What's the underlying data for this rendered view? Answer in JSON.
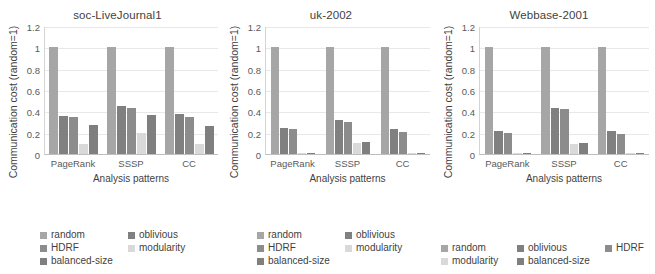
{
  "figure": {
    "background": "#ffffff",
    "series_colors": {
      "random": "#a6a6a6",
      "oblivious": "#808080",
      "HDRF": "#8c8c8c",
      "modularity": "#d9d9d9",
      "balanced-size": "#7f7f7f"
    }
  },
  "axis": {
    "ylabel": "Communication cost (random=1)",
    "xlabel": "Analysis patterns",
    "yticks": [
      "0",
      "0.2",
      "0.4",
      "0.6",
      "0.8",
      "1",
      "1.2"
    ],
    "ymin": 0,
    "ymax": 1.2,
    "xticks": [
      "PageRank",
      "SSSP",
      "CC"
    ]
  },
  "legend": {
    "entries": [
      "random",
      "oblivious",
      "HDRF",
      "modularity",
      "balanced-size"
    ],
    "layout_two_column": [
      "random",
      "oblivious",
      "HDRF",
      "modularity",
      "balanced-size"
    ],
    "layout_three_column": [
      "random",
      "oblivious",
      "HDRF",
      "modularity",
      "balanced-size"
    ]
  },
  "chart_data": [
    {
      "type": "bar",
      "title": "soc-LiveJournal1",
      "xlabel": "Analysis patterns",
      "ylabel": "Communication cost (random=1)",
      "ylim": [
        0,
        1.2
      ],
      "grid": true,
      "legend_position": "bottom",
      "categories": [
        "PageRank",
        "SSSP",
        "CC"
      ],
      "series": [
        {
          "name": "random",
          "values": [
            1.0,
            1.0,
            1.0
          ]
        },
        {
          "name": "oblivious",
          "values": [
            0.355,
            0.45,
            0.375
          ]
        },
        {
          "name": "HDRF",
          "values": [
            0.35,
            0.43,
            0.35
          ]
        },
        {
          "name": "modularity",
          "values": [
            0.09,
            0.2,
            0.09
          ]
        },
        {
          "name": "balanced-size",
          "values": [
            0.275,
            0.365,
            0.265
          ]
        }
      ]
    },
    {
      "type": "bar",
      "title": "uk-2002",
      "xlabel": "Analysis patterns",
      "ylabel": "Communication cost (random=1)",
      "ylim": [
        0,
        1.2
      ],
      "grid": true,
      "legend_position": "bottom",
      "categories": [
        "PageRank",
        "SSSP",
        "CC"
      ],
      "series": [
        {
          "name": "random",
          "values": [
            1.0,
            1.0,
            1.0
          ]
        },
        {
          "name": "oblivious",
          "values": [
            0.24,
            0.32,
            0.23
          ]
        },
        {
          "name": "HDRF",
          "values": [
            0.235,
            0.3,
            0.21
          ]
        },
        {
          "name": "modularity",
          "values": [
            0.005,
            0.105,
            0.005
          ]
        },
        {
          "name": "balanced-size",
          "values": [
            0.012,
            0.11,
            0.008
          ]
        }
      ]
    },
    {
      "type": "bar",
      "title": "Webbase-2001",
      "xlabel": "Analysis patterns",
      "ylabel": "Communication cost (random=1)",
      "ylim": [
        0,
        1.2
      ],
      "grid": true,
      "legend_position": "bottom",
      "categories": [
        "PageRank",
        "SSSP",
        "CC"
      ],
      "series": [
        {
          "name": "random",
          "values": [
            1.0,
            1.0,
            1.0
          ]
        },
        {
          "name": "oblivious",
          "values": [
            0.22,
            0.435,
            0.215
          ]
        },
        {
          "name": "HDRF",
          "values": [
            0.195,
            0.42,
            0.19
          ]
        },
        {
          "name": "modularity",
          "values": [
            0.004,
            0.09,
            0.004
          ]
        },
        {
          "name": "balanced-size",
          "values": [
            0.012,
            0.1,
            0.008
          ]
        }
      ]
    }
  ]
}
